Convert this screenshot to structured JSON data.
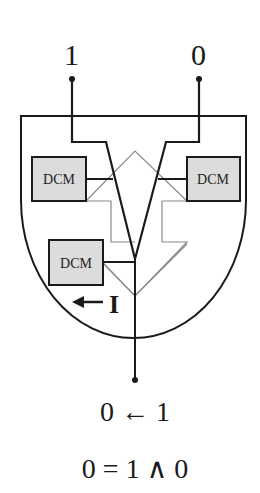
{
  "diagram": {
    "inputs": [
      {
        "label": "1",
        "x": 72
      },
      {
        "label": "0",
        "x": 199
      }
    ],
    "blocks": [
      {
        "label": "DCM",
        "position": "left"
      },
      {
        "label": "DCM",
        "position": "right"
      },
      {
        "label": "DCM",
        "position": "bottom-left"
      }
    ],
    "current_label": "I",
    "current_arrow": "←",
    "output_relation": "0 ← 1",
    "equation": "0 = 1 ∧ 0",
    "colors": {
      "line": "#1a1a1a",
      "gray_path": "#8a8a8a",
      "block_fill": "#dcdcdc",
      "background": "#ffffff"
    }
  }
}
